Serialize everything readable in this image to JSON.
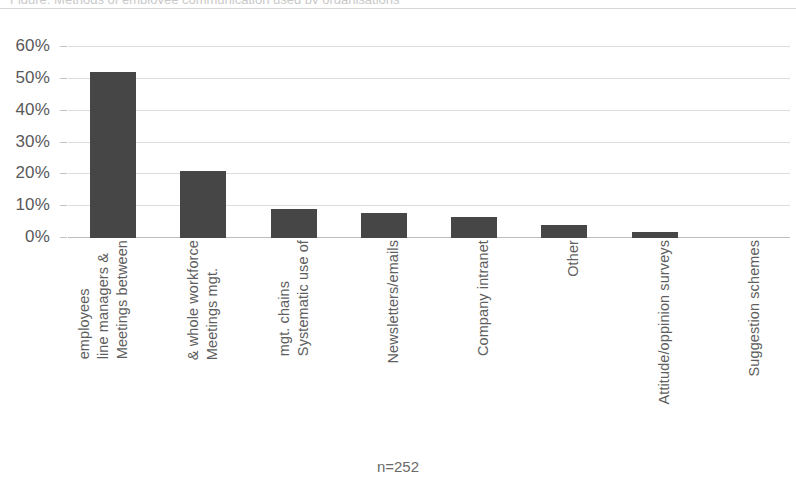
{
  "clipped_title": "Figure: Methods of employee communication used by organisations",
  "footnote": "n=252",
  "colors": {
    "bar": "#464646",
    "gridline": "#dcdcdc",
    "axis": "#bdbdbd",
    "text": "#5e5e5e"
  },
  "chart_data": {
    "type": "bar",
    "title": "",
    "xlabel": "",
    "ylabel": "",
    "ylim": [
      0,
      60
    ],
    "ytick_labels": [
      "60%",
      "50%",
      "40%",
      "30%",
      "20%",
      "10%",
      "0%"
    ],
    "ytick_values": [
      60,
      50,
      40,
      30,
      20,
      10,
      0
    ],
    "grid": true,
    "legend": "none",
    "categories": [
      "Meetings between line managers & employees",
      "Meetings mgt. & whole workforce",
      "Systematic use of mgt. chains",
      "Newsletters/emails",
      "Company intranet",
      "Other",
      "Attitude/oppinion surveys",
      "Suggestion schemes"
    ],
    "category_lines": [
      [
        "Meetings between",
        "line managers &",
        "employees"
      ],
      [
        "Meetings mgt.",
        "& whole workforce"
      ],
      [
        "Systematic use of",
        "mgt. chains"
      ],
      [
        "Newsletters/emails"
      ],
      [
        "Company intranet"
      ],
      [
        "Other"
      ],
      [
        "Attitude/oppinion surveys"
      ],
      [
        "Suggestion schemes"
      ]
    ],
    "values": [
      52,
      21,
      9,
      8,
      6.5,
      4,
      2,
      0
    ],
    "value_labels": [
      "52%",
      "21%",
      "9%",
      "8%",
      "6.5%",
      "4%",
      "2%",
      "0%"
    ]
  }
}
